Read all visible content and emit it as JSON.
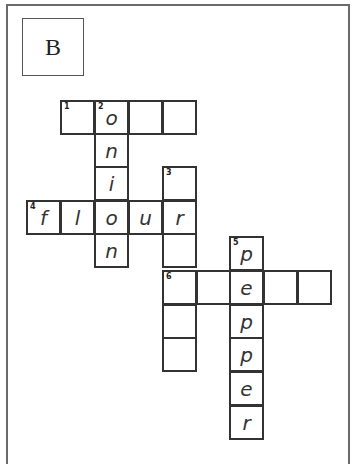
{
  "label": "B",
  "crossword": {
    "cells": [
      {
        "x": 60,
        "y": 100,
        "num": "1",
        "letter": ""
      },
      {
        "x": 94,
        "y": 100,
        "num": "2",
        "letter": "o"
      },
      {
        "x": 128,
        "y": 100,
        "num": "",
        "letter": ""
      },
      {
        "x": 162,
        "y": 100,
        "num": "",
        "letter": ""
      },
      {
        "x": 94,
        "y": 133,
        "num": "",
        "letter": "n"
      },
      {
        "x": 94,
        "y": 166,
        "num": "",
        "letter": "i"
      },
      {
        "x": 162,
        "y": 166,
        "num": "3",
        "letter": ""
      },
      {
        "x": 26,
        "y": 200,
        "num": "4",
        "letter": "f"
      },
      {
        "x": 60,
        "y": 200,
        "num": "",
        "letter": "l"
      },
      {
        "x": 94,
        "y": 200,
        "num": "",
        "letter": "o"
      },
      {
        "x": 128,
        "y": 200,
        "num": "",
        "letter": "u"
      },
      {
        "x": 162,
        "y": 200,
        "num": "",
        "letter": "r"
      },
      {
        "x": 94,
        "y": 233,
        "num": "",
        "letter": "n"
      },
      {
        "x": 162,
        "y": 233,
        "num": "",
        "letter": ""
      },
      {
        "x": 229,
        "y": 236,
        "num": "5",
        "letter": "p"
      },
      {
        "x": 162,
        "y": 270,
        "num": "6",
        "letter": ""
      },
      {
        "x": 196,
        "y": 270,
        "num": "",
        "letter": ""
      },
      {
        "x": 229,
        "y": 270,
        "num": "",
        "letter": "e"
      },
      {
        "x": 263,
        "y": 270,
        "num": "",
        "letter": ""
      },
      {
        "x": 297,
        "y": 270,
        "num": "",
        "letter": ""
      },
      {
        "x": 162,
        "y": 304,
        "num": "",
        "letter": ""
      },
      {
        "x": 229,
        "y": 304,
        "num": "",
        "letter": "p"
      },
      {
        "x": 162,
        "y": 337,
        "num": "",
        "letter": ""
      },
      {
        "x": 229,
        "y": 337,
        "num": "",
        "letter": "p"
      },
      {
        "x": 229,
        "y": 371,
        "num": "",
        "letter": "e"
      },
      {
        "x": 229,
        "y": 405,
        "num": "",
        "letter": "r"
      }
    ],
    "answers": {
      "2_down": "onion",
      "4_across": "flour",
      "5_down": "pepper"
    }
  }
}
